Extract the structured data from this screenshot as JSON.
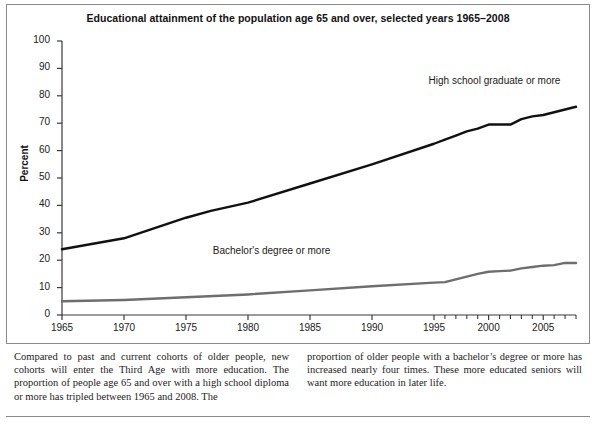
{
  "chart_data": {
    "type": "line",
    "title": "Educational attainment of the population age 65 and over, selected years 1965–2008",
    "xlabel": "",
    "ylabel": "Percent",
    "ylim": [
      0,
      100
    ],
    "xlim": [
      1965,
      2008
    ],
    "ytick_labels": [
      "0",
      "10",
      "20",
      "30",
      "40",
      "50",
      "60",
      "70",
      "80",
      "90",
      "100"
    ],
    "ytick_values": [
      0,
      10,
      20,
      30,
      40,
      50,
      60,
      70,
      80,
      90,
      100
    ],
    "xtick_labels": [
      "1965",
      "1970",
      "1975",
      "1980",
      "1985",
      "1990",
      "1995",
      "2000",
      "2005"
    ],
    "xtick_values": [
      1965,
      1970,
      1975,
      1980,
      1985,
      1990,
      1995,
      2000,
      2005
    ],
    "minor_xticks": [
      1996,
      1997,
      1998,
      1999,
      2001,
      2002,
      2003,
      2004,
      2006,
      2007,
      2008
    ],
    "grid": false,
    "legend_position": "inline-annotations",
    "series": [
      {
        "name": "High school graduate or more",
        "color": "#111111",
        "linewidth": 2.4,
        "label_x": 2000,
        "label_y": 85,
        "x": [
          1965,
          1970,
          1975,
          1977,
          1980,
          1985,
          1990,
          1995,
          1996,
          1997,
          1998,
          1999,
          2000,
          2001,
          2002,
          2003,
          2004,
          2005,
          2006,
          2007,
          2008
        ],
        "values": [
          24,
          28,
          35.5,
          38,
          41,
          48,
          55,
          62.5,
          64,
          65.5,
          67,
          68,
          69.5,
          69.5,
          69.5,
          71.5,
          72.5,
          73,
          74,
          75,
          76
        ]
      },
      {
        "name": "Bachelor's degree or more",
        "color": "#6e6e6e",
        "linewidth": 2.4,
        "label_x": 1982,
        "label_y": 23,
        "x": [
          1965,
          1970,
          1975,
          1980,
          1985,
          1990,
          1995,
          1996,
          1997,
          1998,
          1999,
          2000,
          2001,
          2002,
          2003,
          2004,
          2005,
          2006,
          2007,
          2008
        ],
        "values": [
          5,
          5.5,
          6.5,
          7.5,
          9,
          10.5,
          11.8,
          12,
          13,
          14,
          15,
          15.8,
          16,
          16.2,
          17,
          17.5,
          18,
          18.2,
          19,
          19
        ]
      }
    ]
  },
  "caption": {
    "column_left": "Compared to past and current cohorts of older people, new cohorts will enter the Third Age with more education. The proportion of people age 65 and over with a high school diploma or more has tripled between 1965 and 2008. The",
    "column_right": "proportion of older people with a bachelor’s degree or more has increased nearly four times. These more educated seniors will want more education in later life."
  }
}
